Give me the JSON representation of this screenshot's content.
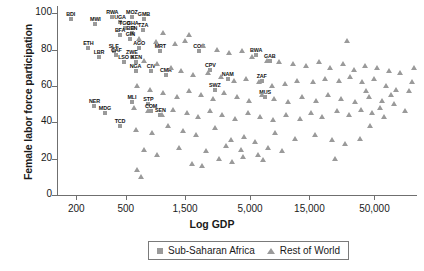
{
  "chart_data": {
    "type": "scatter",
    "title": "",
    "xlabel": "Log GDP",
    "ylabel": "Female labor force participation",
    "xticklabels": [
      "200",
      "500",
      "1,500",
      "5,000",
      "15,000",
      "50,000"
    ],
    "xtickvalues": [
      200,
      500,
      1500,
      5000,
      15000,
      50000
    ],
    "yticklabels": [
      "0",
      "20",
      "40",
      "60",
      "80",
      "100"
    ],
    "ytickvalues": [
      0,
      20,
      40,
      60,
      80,
      100
    ],
    "ylim": [
      0,
      104
    ],
    "xlim_log": [
      140,
      110000
    ],
    "grid": false,
    "legend_position": "bottom-center",
    "legend": [
      {
        "label": "Sub-Saharan Africa",
        "marker": "square",
        "color": "#9a9a9a"
      },
      {
        "label": "Rest of World",
        "marker": "triangle",
        "color": "#9a9a9a"
      }
    ],
    "series": [
      {
        "name": "Sub-Saharan Africa",
        "marker": "square",
        "color": "#9a9a9a",
        "labelled": true,
        "points": [
          {
            "label": "BDI",
            "gdp": 180,
            "flfp": 97
          },
          {
            "label": "MWI",
            "gdp": 285,
            "flfp": 94
          },
          {
            "label": "RWA",
            "gdp": 390,
            "flfp": 98
          },
          {
            "label": "UGA",
            "gdp": 450,
            "flfp": 95
          },
          {
            "label": "MOZ",
            "gdp": 560,
            "flfp": 98
          },
          {
            "label": "GMB",
            "gdp": 700,
            "flfp": 97
          },
          {
            "label": "TGO",
            "gdp": 490,
            "flfp": 92
          },
          {
            "label": "GHA",
            "gdp": 570,
            "flfp": 92
          },
          {
            "label": "TZA",
            "gdp": 690,
            "flfp": 91
          },
          {
            "label": "BEN",
            "gdp": 560,
            "flfp": 89
          },
          {
            "label": "BFA",
            "gdp": 450,
            "flfp": 88
          },
          {
            "label": "GIN",
            "gdp": 545,
            "flfp": 86
          },
          {
            "label": "ETH",
            "gdp": 250,
            "flfp": 81
          },
          {
            "label": "AGO",
            "gdp": 640,
            "flfp": 81
          },
          {
            "label": "MRT",
            "gdp": 950,
            "flfp": 79
          },
          {
            "label": "COG",
            "gdp": 1950,
            "flfp": 79
          },
          {
            "label": "LBR",
            "gdp": 305,
            "flfp": 76
          },
          {
            "label": "SLE",
            "gdp": 400,
            "flfp": 79
          },
          {
            "label": "CAF",
            "gdp": 420,
            "flfp": 77
          },
          {
            "label": "LSO",
            "gdp": 480,
            "flfp": 73
          },
          {
            "label": "ZWE",
            "gdp": 560,
            "flfp": 76
          },
          {
            "label": "KEN",
            "gdp": 610,
            "flfp": 73
          },
          {
            "label": "NGA",
            "gdp": 600,
            "flfp": 68
          },
          {
            "label": "CIV",
            "gdp": 800,
            "flfp": 68
          },
          {
            "label": "CMR",
            "gdp": 1050,
            "flfp": 66
          },
          {
            "label": "BWA",
            "gdp": 5600,
            "flfp": 77
          },
          {
            "label": "GAB",
            "gdp": 7200,
            "flfp": 74
          },
          {
            "label": "CPV",
            "gdp": 2400,
            "flfp": 69
          },
          {
            "label": "NAM",
            "gdp": 3300,
            "flfp": 64
          },
          {
            "label": "ZAF",
            "gdp": 6200,
            "flfp": 63
          },
          {
            "label": "SWZ",
            "gdp": 2600,
            "flfp": 58
          },
          {
            "label": "MUS",
            "gdp": 6600,
            "flfp": 54
          },
          {
            "label": "NER",
            "gdp": 280,
            "flfp": 49
          },
          {
            "label": "MDG",
            "gdp": 340,
            "flfp": 45
          },
          {
            "label": "MLI",
            "gdp": 560,
            "flfp": 51
          },
          {
            "label": "STP",
            "gdp": 760,
            "flfp": 50
          },
          {
            "label": "COM",
            "gdp": 800,
            "flfp": 46
          },
          {
            "label": "SEN",
            "gdp": 950,
            "flfp": 44
          },
          {
            "label": "TCD",
            "gdp": 450,
            "flfp": 38
          }
        ]
      },
      {
        "name": "Rest of World",
        "marker": "triangle",
        "color": "#9a9a9a",
        "labelled": false,
        "points": [
          {
            "gdp": 640,
            "flfp": 86
          },
          {
            "gdp": 880,
            "flfp": 84
          },
          {
            "gdp": 1250,
            "flfp": 83
          },
          {
            "gdp": 1500,
            "flfp": 85
          },
          {
            "gdp": 2100,
            "flfp": 82
          },
          {
            "gdp": 2700,
            "flfp": 80
          },
          {
            "gdp": 3400,
            "flfp": 78
          },
          {
            "gdp": 4300,
            "flfp": 79
          },
          {
            "gdp": 5200,
            "flfp": 76
          },
          {
            "gdp": 6800,
            "flfp": 74
          },
          {
            "gdp": 8500,
            "flfp": 73
          },
          {
            "gdp": 11000,
            "flfp": 72
          },
          {
            "gdp": 14000,
            "flfp": 71
          },
          {
            "gdp": 18000,
            "flfp": 73
          },
          {
            "gdp": 22000,
            "flfp": 70
          },
          {
            "gdp": 28000,
            "flfp": 72
          },
          {
            "gdp": 34000,
            "flfp": 69
          },
          {
            "gdp": 42000,
            "flfp": 71
          },
          {
            "gdp": 52000,
            "flfp": 70
          },
          {
            "gdp": 66000,
            "flfp": 68
          },
          {
            "gdp": 80000,
            "flfp": 67
          },
          {
            "gdp": 700,
            "flfp": 74
          },
          {
            "gdp": 900,
            "flfp": 72
          },
          {
            "gdp": 1150,
            "flfp": 70
          },
          {
            "gdp": 1400,
            "flfp": 68
          },
          {
            "gdp": 1750,
            "flfp": 66
          },
          {
            "gdp": 2300,
            "flfp": 67
          },
          {
            "gdp": 2900,
            "flfp": 65
          },
          {
            "gdp": 3700,
            "flfp": 63
          },
          {
            "gdp": 4600,
            "flfp": 64
          },
          {
            "gdp": 5900,
            "flfp": 62
          },
          {
            "gdp": 7500,
            "flfp": 60
          },
          {
            "gdp": 9500,
            "flfp": 61
          },
          {
            "gdp": 12000,
            "flfp": 63
          },
          {
            "gdp": 16000,
            "flfp": 62
          },
          {
            "gdp": 20000,
            "flfp": 64
          },
          {
            "gdp": 26000,
            "flfp": 63
          },
          {
            "gdp": 32000,
            "flfp": 65
          },
          {
            "gdp": 40000,
            "flfp": 62
          },
          {
            "gdp": 50000,
            "flfp": 64
          },
          {
            "gdp": 62000,
            "flfp": 60
          },
          {
            "gdp": 75000,
            "flfp": 58
          },
          {
            "gdp": 95000,
            "flfp": 57
          },
          {
            "gdp": 620,
            "flfp": 60
          },
          {
            "gdp": 780,
            "flfp": 58
          },
          {
            "gdp": 1000,
            "flfp": 56
          },
          {
            "gdp": 1300,
            "flfp": 54
          },
          {
            "gdp": 1600,
            "flfp": 57
          },
          {
            "gdp": 2000,
            "flfp": 55
          },
          {
            "gdp": 2500,
            "flfp": 53
          },
          {
            "gdp": 3100,
            "flfp": 56
          },
          {
            "gdp": 3900,
            "flfp": 54
          },
          {
            "gdp": 4900,
            "flfp": 52
          },
          {
            "gdp": 6200,
            "flfp": 55
          },
          {
            "gdp": 7800,
            "flfp": 53
          },
          {
            "gdp": 10000,
            "flfp": 51
          },
          {
            "gdp": 13000,
            "flfp": 54
          },
          {
            "gdp": 17000,
            "flfp": 52
          },
          {
            "gdp": 21000,
            "flfp": 55
          },
          {
            "gdp": 27000,
            "flfp": 53
          },
          {
            "gdp": 35000,
            "flfp": 51
          },
          {
            "gdp": 45000,
            "flfp": 54
          },
          {
            "gdp": 58000,
            "flfp": 52
          },
          {
            "gdp": 72000,
            "flfp": 50
          },
          {
            "gdp": 580,
            "flfp": 48
          },
          {
            "gdp": 760,
            "flfp": 46
          },
          {
            "gdp": 980,
            "flfp": 44
          },
          {
            "gdp": 1200,
            "flfp": 47
          },
          {
            "gdp": 1550,
            "flfp": 45
          },
          {
            "gdp": 1900,
            "flfp": 43
          },
          {
            "gdp": 2400,
            "flfp": 46
          },
          {
            "gdp": 3000,
            "flfp": 44
          },
          {
            "gdp": 3800,
            "flfp": 42
          },
          {
            "gdp": 4800,
            "flfp": 45
          },
          {
            "gdp": 6000,
            "flfp": 43
          },
          {
            "gdp": 7600,
            "flfp": 41
          },
          {
            "gdp": 9800,
            "flfp": 44
          },
          {
            "gdp": 12500,
            "flfp": 42
          },
          {
            "gdp": 15500,
            "flfp": 45
          },
          {
            "gdp": 19000,
            "flfp": 43
          },
          {
            "gdp": 25000,
            "flfp": 46
          },
          {
            "gdp": 31000,
            "flfp": 44
          },
          {
            "gdp": 39000,
            "flfp": 47
          },
          {
            "gdp": 48000,
            "flfp": 45
          },
          {
            "gdp": 60000,
            "flfp": 43
          },
          {
            "gdp": 600,
            "flfp": 36
          },
          {
            "gdp": 820,
            "flfp": 34
          },
          {
            "gdp": 1100,
            "flfp": 38
          },
          {
            "gdp": 1450,
            "flfp": 35
          },
          {
            "gdp": 1850,
            "flfp": 33
          },
          {
            "gdp": 2600,
            "flfp": 37
          },
          {
            "gdp": 3500,
            "flfp": 30
          },
          {
            "gdp": 4500,
            "flfp": 32
          },
          {
            "gdp": 5500,
            "flfp": 29
          },
          {
            "gdp": 8000,
            "flfp": 34
          },
          {
            "gdp": 11500,
            "flfp": 31
          },
          {
            "gdp": 16500,
            "flfp": 33
          },
          {
            "gdp": 23000,
            "flfp": 30
          },
          {
            "gdp": 29000,
            "flfp": 28
          },
          {
            "gdp": 38000,
            "flfp": 31
          },
          {
            "gdp": 1350,
            "flfp": 26
          },
          {
            "gdp": 2200,
            "flfp": 24
          },
          {
            "gdp": 3200,
            "flfp": 27
          },
          {
            "gdp": 4200,
            "flfp": 25
          },
          {
            "gdp": 5800,
            "flfp": 22
          },
          {
            "gdp": 7000,
            "flfp": 26
          },
          {
            "gdp": 9000,
            "flfp": 24
          },
          {
            "gdp": 2800,
            "flfp": 20
          },
          {
            "gdp": 3600,
            "flfp": 18
          },
          {
            "gdp": 4400,
            "flfp": 21
          },
          {
            "gdp": 6400,
            "flfp": 19
          },
          {
            "gdp": 700,
            "flfp": 25
          },
          {
            "gdp": 900,
            "flfp": 22
          },
          {
            "gdp": 620,
            "flfp": 14
          },
          {
            "gdp": 660,
            "flfp": 10
          },
          {
            "gdp": 1700,
            "flfp": 17
          },
          {
            "gdp": 2050,
            "flfp": 16
          },
          {
            "gdp": 24000,
            "flfp": 20
          },
          {
            "gdp": 46000,
            "flfp": 38
          },
          {
            "gdp": 88000,
            "flfp": 46
          },
          {
            "gdp": 30000,
            "flfp": 85
          },
          {
            "gdp": 1000,
            "flfp": 89
          },
          {
            "gdp": 1600,
            "flfp": 88
          },
          {
            "gdp": 43000,
            "flfp": 57
          },
          {
            "gdp": 55000,
            "flfp": 48
          },
          {
            "gdp": 68000,
            "flfp": 55
          },
          {
            "gdp": 100000,
            "flfp": 62
          },
          {
            "gdp": 105000,
            "flfp": 70
          }
        ]
      }
    ]
  }
}
